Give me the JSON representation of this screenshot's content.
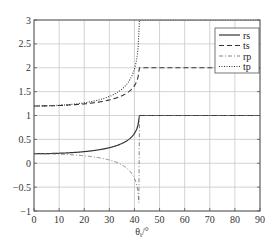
{
  "chart_data": {
    "type": "line",
    "title": "",
    "xlabel": "θi/°",
    "ylabel": "",
    "xlim": [
      0,
      90
    ],
    "ylim": [
      -1,
      3
    ],
    "xticks": [
      0,
      10,
      20,
      30,
      40,
      50,
      60,
      70,
      80,
      90
    ],
    "yticks": [
      -1,
      -0.5,
      0,
      0.5,
      1,
      1.5,
      2,
      2.5,
      3
    ],
    "ytick_labels": [
      "−1",
      "−0.5",
      "0",
      "0.5",
      "1",
      "1.5",
      "2",
      "2.5",
      "3"
    ],
    "grid": true,
    "legend_position": "upper right",
    "critical_angle_deg": 41.8,
    "x": [
      0,
      10,
      20,
      30,
      35,
      38,
      40,
      41,
      41.8,
      45,
      50,
      60,
      70,
      80,
      90
    ],
    "series": [
      {
        "name": "rs",
        "style": "solid",
        "values": [
          0.2,
          0.19,
          0.22,
          0.33,
          0.44,
          0.56,
          0.69,
          0.8,
          1.0,
          1.0,
          1.0,
          1.0,
          1.0,
          1.0,
          1.0
        ]
      },
      {
        "name": "ts",
        "style": "dashed",
        "values": [
          1.2,
          1.21,
          1.26,
          1.37,
          1.47,
          1.58,
          1.69,
          1.8,
          2.0,
          2.0,
          2.0,
          2.0,
          2.0,
          2.0,
          2.0
        ]
      },
      {
        "name": "rp",
        "style": "dashdot",
        "values": [
          -0.2,
          -0.19,
          -0.15,
          -0.03,
          0.1,
          0.27,
          0.5,
          0.7,
          1.0,
          1.0,
          1.0,
          1.0,
          1.0,
          1.0,
          1.0
        ]
      },
      {
        "name": "tp",
        "style": "dotted",
        "values": [
          1.2,
          1.21,
          1.27,
          1.41,
          1.55,
          1.73,
          2.0,
          2.4,
          3.0,
          3.0,
          3.0,
          3.0,
          3.0,
          3.0,
          3.0
        ]
      }
    ]
  },
  "legend": {
    "items": [
      {
        "label": "rs",
        "style": "solid"
      },
      {
        "label": "ts",
        "style": "dashed"
      },
      {
        "label": "rp",
        "style": "dashdot"
      },
      {
        "label": "tp",
        "style": "dotted"
      }
    ]
  },
  "axes": {
    "xlabel_main": "θ",
    "xlabel_sub": "i",
    "xlabel_unit": "/°"
  }
}
